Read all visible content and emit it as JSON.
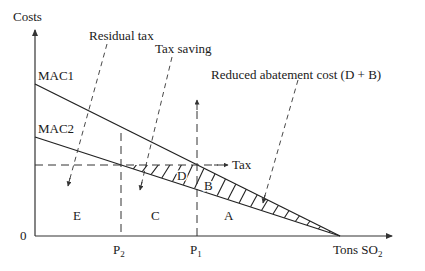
{
  "diagram": {
    "type": "economics-tax-diagram",
    "axes": {
      "y_label": "Costs",
      "x_label_main": "Tons SO",
      "x_label_sub": "2",
      "origin_label": "0"
    },
    "curves": [
      {
        "name": "MAC1",
        "label": "MAC1"
      },
      {
        "name": "MAC2",
        "label": "MAC2"
      }
    ],
    "tax_line": {
      "label": "Tax"
    },
    "x_ticks": [
      {
        "main": "P",
        "sub": "2"
      },
      {
        "main": "P",
        "sub": "1"
      }
    ],
    "regions": {
      "A": "A",
      "B": "B",
      "C": "C",
      "D": "D",
      "E": "E"
    },
    "annotations": {
      "residual_tax": "Residual tax",
      "tax_saving": "Tax saving",
      "reduced_abatement": "Reduced abatement cost (D + B)"
    },
    "colors": {
      "line": "#222222",
      "background": "#ffffff"
    }
  }
}
